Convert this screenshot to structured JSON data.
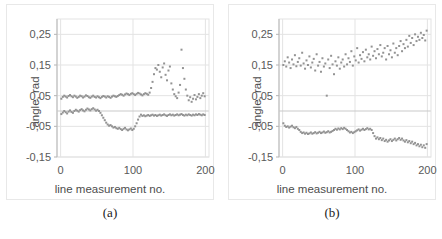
{
  "figure": {
    "panels": [
      {
        "id": "a",
        "caption": "(a)",
        "xlabel": "line measurement no.",
        "ylabel": "angle, rad"
      },
      {
        "id": "b",
        "caption": "(b)",
        "xlabel": "line measurement no.",
        "ylabel": "angle, rad"
      }
    ]
  },
  "axis": {
    "yticks": [
      "0,25",
      "0,15",
      "0,05",
      "-0,05",
      "-0,15"
    ],
    "ytick_values": [
      0.25,
      0.15,
      0.05,
      -0.05,
      -0.15
    ],
    "xticks": [
      "0",
      "100",
      "200"
    ],
    "xtick_values": [
      0,
      100,
      200
    ]
  },
  "style": {
    "marker_color": "#939393",
    "grid_color": "#e3e3e3",
    "axis_color": "#b5b5b5",
    "text_color": "#595959",
    "panel_border": "#e8e8e8",
    "marker_size": 2.0
  },
  "chart_data": [
    {
      "type": "scatter",
      "title": "(a)",
      "xlabel": "line measurement no.",
      "ylabel": "angle, rad",
      "xlim": [
        -5,
        205
      ],
      "ylim": [
        -0.15,
        0.3
      ],
      "grid": true,
      "legend": "none",
      "series": [
        {
          "name": "upper series",
          "x": [
            1,
            3,
            5,
            7,
            9,
            11,
            13,
            15,
            17,
            19,
            21,
            23,
            25,
            27,
            29,
            31,
            33,
            35,
            37,
            39,
            41,
            43,
            45,
            47,
            49,
            51,
            53,
            55,
            57,
            59,
            61,
            63,
            65,
            67,
            69,
            71,
            73,
            75,
            77,
            79,
            81,
            83,
            85,
            87,
            89,
            91,
            93,
            95,
            97,
            99,
            101,
            103,
            105,
            107,
            109,
            111,
            113,
            115,
            117,
            119,
            121,
            123,
            125,
            127,
            129,
            131,
            133,
            135,
            137,
            139,
            141,
            143,
            145,
            147,
            149,
            151,
            153,
            155,
            157,
            159,
            161,
            163,
            165,
            167,
            169,
            171,
            173,
            175,
            177,
            179,
            181,
            183,
            185,
            187,
            189,
            191,
            193,
            195,
            197,
            199
          ],
          "y": [
            0.04,
            0.046,
            0.05,
            0.047,
            0.044,
            0.049,
            0.052,
            0.048,
            0.045,
            0.05,
            0.047,
            0.043,
            0.046,
            0.05,
            0.048,
            0.044,
            0.047,
            0.051,
            0.049,
            0.045,
            0.043,
            0.047,
            0.05,
            0.046,
            0.044,
            0.048,
            0.045,
            0.042,
            0.046,
            0.049,
            0.047,
            0.044,
            0.048,
            0.046,
            0.043,
            0.047,
            0.05,
            0.048,
            0.046,
            0.049,
            0.052,
            0.055,
            0.053,
            0.05,
            0.054,
            0.057,
            0.055,
            0.052,
            0.056,
            0.058,
            0.055,
            0.052,
            0.056,
            0.059,
            0.057,
            0.054,
            0.051,
            0.055,
            0.058,
            0.056,
            0.053,
            0.06,
            0.075,
            0.095,
            0.12,
            0.14,
            0.135,
            0.15,
            0.128,
            0.11,
            0.142,
            0.155,
            0.118,
            0.1,
            0.132,
            0.145,
            0.09,
            0.07,
            0.055,
            0.048,
            0.042,
            0.06,
            0.085,
            0.2,
            0.14,
            0.105,
            0.07,
            0.05,
            0.035,
            0.045,
            0.03,
            0.04,
            0.052,
            0.038,
            0.046,
            0.055,
            0.042,
            0.05,
            0.058,
            0.048
          ]
        },
        {
          "name": "lower series",
          "x": [
            1,
            3,
            5,
            7,
            9,
            11,
            13,
            15,
            17,
            19,
            21,
            23,
            25,
            27,
            29,
            31,
            33,
            35,
            37,
            39,
            41,
            43,
            45,
            47,
            49,
            51,
            53,
            55,
            57,
            59,
            61,
            63,
            65,
            67,
            69,
            71,
            73,
            75,
            77,
            79,
            81,
            83,
            85,
            87,
            89,
            91,
            93,
            95,
            97,
            99,
            101,
            103,
            105,
            107,
            109,
            111,
            113,
            115,
            117,
            119,
            121,
            123,
            125,
            127,
            129,
            131,
            133,
            135,
            137,
            139,
            141,
            143,
            145,
            147,
            149,
            151,
            153,
            155,
            157,
            159,
            161,
            163,
            165,
            167,
            169,
            171,
            173,
            175,
            177,
            179,
            181,
            183,
            185,
            187,
            189,
            191,
            193,
            195,
            197,
            199
          ],
          "y": [
            -0.01,
            -0.005,
            0.0,
            -0.004,
            -0.008,
            -0.002,
            0.002,
            -0.003,
            -0.006,
            0.0,
            0.004,
            0.001,
            -0.002,
            0.003,
            0.006,
            0.002,
            -0.001,
            0.004,
            0.008,
            0.005,
            0.002,
            0.006,
            0.009,
            0.005,
            0.001,
            0.004,
            0.0,
            -0.006,
            -0.014,
            -0.022,
            -0.03,
            -0.038,
            -0.044,
            -0.048,
            -0.046,
            -0.05,
            -0.054,
            -0.052,
            -0.056,
            -0.058,
            -0.055,
            -0.059,
            -0.062,
            -0.058,
            -0.055,
            -0.06,
            -0.063,
            -0.06,
            -0.057,
            -0.062,
            -0.058,
            -0.05,
            -0.04,
            -0.028,
            -0.018,
            -0.012,
            -0.016,
            -0.014,
            -0.017,
            -0.015,
            -0.013,
            -0.016,
            -0.014,
            -0.012,
            -0.015,
            -0.013,
            -0.016,
            -0.014,
            -0.012,
            -0.015,
            -0.013,
            -0.011,
            -0.014,
            -0.016,
            -0.013,
            -0.011,
            -0.014,
            -0.012,
            -0.015,
            -0.013,
            -0.011,
            -0.014,
            -0.012,
            -0.01,
            -0.013,
            -0.015,
            -0.012,
            -0.014,
            -0.011,
            -0.013,
            -0.015,
            -0.012,
            -0.014,
            -0.011,
            -0.013,
            -0.01,
            -0.012,
            -0.014,
            -0.011,
            -0.013
          ]
        }
      ]
    },
    {
      "type": "scatter",
      "title": "(b)",
      "xlabel": "line measurement no.",
      "ylabel": "angle, rad",
      "xlim": [
        -5,
        205
      ],
      "ylim": [
        -0.15,
        0.3
      ],
      "grid": true,
      "legend": "none",
      "series": [
        {
          "name": "upper series",
          "x": [
            1,
            3,
            5,
            7,
            9,
            11,
            13,
            15,
            17,
            19,
            21,
            23,
            25,
            27,
            29,
            31,
            33,
            35,
            37,
            39,
            41,
            43,
            45,
            47,
            49,
            51,
            53,
            55,
            57,
            59,
            61,
            63,
            65,
            67,
            69,
            71,
            73,
            75,
            77,
            79,
            81,
            83,
            85,
            87,
            89,
            91,
            93,
            95,
            97,
            99,
            101,
            103,
            105,
            107,
            109,
            111,
            113,
            115,
            117,
            119,
            121,
            123,
            125,
            127,
            129,
            131,
            133,
            135,
            137,
            139,
            141,
            143,
            145,
            147,
            149,
            151,
            153,
            155,
            157,
            159,
            161,
            163,
            165,
            167,
            169,
            171,
            173,
            175,
            177,
            179,
            181,
            183,
            185,
            187,
            189,
            191,
            193,
            195,
            197,
            199
          ],
          "y": [
            0.15,
            0.162,
            0.145,
            0.175,
            0.158,
            0.14,
            0.168,
            0.152,
            0.182,
            0.146,
            0.16,
            0.172,
            0.148,
            0.19,
            0.155,
            0.138,
            0.165,
            0.15,
            0.178,
            0.142,
            0.158,
            0.17,
            0.132,
            0.185,
            0.148,
            0.16,
            0.128,
            0.172,
            0.145,
            0.155,
            0.05,
            0.168,
            0.14,
            0.18,
            0.152,
            0.12,
            0.162,
            0.148,
            0.175,
            0.138,
            0.158,
            0.168,
            0.145,
            0.185,
            0.152,
            0.172,
            0.16,
            0.195,
            0.148,
            0.178,
            0.165,
            0.205,
            0.158,
            0.182,
            0.17,
            0.192,
            0.162,
            0.2,
            0.175,
            0.185,
            0.168,
            0.21,
            0.18,
            0.195,
            0.172,
            0.202,
            0.185,
            0.215,
            0.178,
            0.19,
            0.205,
            0.168,
            0.212,
            0.185,
            0.198,
            0.175,
            0.22,
            0.19,
            0.205,
            0.182,
            0.212,
            0.228,
            0.195,
            0.218,
            0.205,
            0.232,
            0.21,
            0.245,
            0.222,
            0.238,
            0.215,
            0.25,
            0.228,
            0.242,
            0.232,
            0.255,
            0.238,
            0.248,
            0.23,
            0.262
          ]
        },
        {
          "name": "lower series",
          "x": [
            1,
            3,
            5,
            7,
            9,
            11,
            13,
            15,
            17,
            19,
            21,
            23,
            25,
            27,
            29,
            31,
            33,
            35,
            37,
            39,
            41,
            43,
            45,
            47,
            49,
            51,
            53,
            55,
            57,
            59,
            61,
            63,
            65,
            67,
            69,
            71,
            73,
            75,
            77,
            79,
            81,
            83,
            85,
            87,
            89,
            91,
            93,
            95,
            97,
            99,
            101,
            103,
            105,
            107,
            109,
            111,
            113,
            115,
            117,
            119,
            121,
            123,
            125,
            127,
            129,
            131,
            133,
            135,
            137,
            139,
            141,
            143,
            145,
            147,
            149,
            151,
            153,
            155,
            157,
            159,
            161,
            163,
            165,
            167,
            169,
            171,
            173,
            175,
            177,
            179,
            181,
            183,
            185,
            187,
            189,
            191,
            193,
            195,
            197,
            199
          ],
          "y": [
            -0.04,
            -0.048,
            -0.052,
            -0.05,
            -0.054,
            -0.051,
            -0.048,
            -0.053,
            -0.056,
            -0.052,
            -0.058,
            -0.062,
            -0.068,
            -0.072,
            -0.07,
            -0.074,
            -0.071,
            -0.075,
            -0.073,
            -0.07,
            -0.074,
            -0.072,
            -0.069,
            -0.073,
            -0.071,
            -0.068,
            -0.072,
            -0.07,
            -0.067,
            -0.071,
            -0.069,
            -0.066,
            -0.07,
            -0.068,
            -0.065,
            -0.062,
            -0.058,
            -0.061,
            -0.057,
            -0.06,
            -0.056,
            -0.059,
            -0.055,
            -0.058,
            -0.062,
            -0.066,
            -0.07,
            -0.068,
            -0.072,
            -0.069,
            -0.066,
            -0.063,
            -0.06,
            -0.064,
            -0.061,
            -0.058,
            -0.062,
            -0.059,
            -0.056,
            -0.06,
            -0.058,
            -0.062,
            -0.072,
            -0.082,
            -0.09,
            -0.086,
            -0.092,
            -0.088,
            -0.095,
            -0.09,
            -0.098,
            -0.094,
            -0.1,
            -0.096,
            -0.092,
            -0.098,
            -0.094,
            -0.09,
            -0.096,
            -0.092,
            -0.088,
            -0.094,
            -0.09,
            -0.096,
            -0.1,
            -0.095,
            -0.102,
            -0.098,
            -0.105,
            -0.1,
            -0.108,
            -0.104,
            -0.112,
            -0.108,
            -0.115,
            -0.11,
            -0.118,
            -0.112,
            -0.12,
            -0.108
          ]
        }
      ]
    }
  ]
}
